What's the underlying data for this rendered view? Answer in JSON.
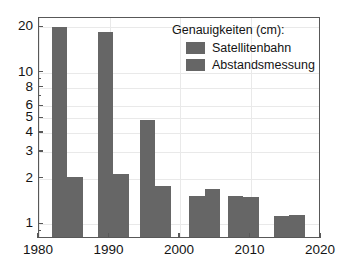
{
  "chart_data": {
    "type": "bar",
    "title": "",
    "xlabel": "",
    "ylabel": "",
    "yscale": "log",
    "ylim": [
      0.8,
      23
    ],
    "xlim": [
      1980,
      2020
    ],
    "grid": true,
    "legend_position": "top-right",
    "legend_title": "Genauigkeiten (cm):",
    "xticks": [
      "1980",
      "1990",
      "2000",
      "2010",
      "2020"
    ],
    "xtick_values": [
      1980,
      1990,
      2000,
      2010,
      2020
    ],
    "yticks": [
      "1",
      "2",
      "3",
      "4",
      "5",
      "6",
      "8",
      "10",
      "20"
    ],
    "ytick_values": [
      1,
      2,
      3,
      4,
      5,
      6,
      8,
      10,
      20
    ],
    "categories": [
      "1984",
      "1990",
      "1996",
      "2003",
      "2009",
      "2015"
    ],
    "x": [
      1984,
      1990.5,
      1996.5,
      2003.5,
      2009,
      2015.5
    ],
    "series": [
      {
        "name": "Satellitenbahn",
        "color": "#666666",
        "values": [
          20.0,
          18.5,
          4.9,
          1.55,
          1.55,
          1.13
        ]
      },
      {
        "name": "Abstandsmessung",
        "color": "#666666",
        "values": [
          2.05,
          2.15,
          1.8,
          1.72,
          1.52,
          1.16
        ]
      }
    ]
  },
  "legend": {
    "title": "Genauigkeiten (cm):",
    "entries": [
      {
        "label": "Satellitenbahn",
        "color": "#666666"
      },
      {
        "label": "Abstandsmessung",
        "color": "#666666"
      }
    ]
  },
  "axes": {
    "y_labels": [
      "20",
      "10",
      "8",
      "6",
      "5",
      "4",
      "3",
      "2",
      "1"
    ],
    "x_labels": [
      "1980",
      "1990",
      "2000",
      "2010",
      "2020"
    ]
  },
  "colors": {
    "bar": "#666666",
    "axis": "#585858",
    "grid": "#e9e9e9",
    "text": "#141414",
    "background": "#ffffff"
  }
}
